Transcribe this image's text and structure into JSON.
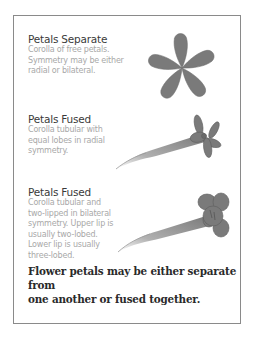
{
  "sections": [
    {
      "title": "Petals Separate",
      "lines": [
        "Corolla of free petals.",
        "Symmetry may be either",
        "radial or bilateral."
      ]
    },
    {
      "title": "Petals Fused",
      "lines": [
        "Corolla tubular with",
        "equal lobes in radial",
        "symmetry."
      ]
    },
    {
      "title": "Petals Fused",
      "lines": [
        "Corolla tubular and",
        "two-lipped in bilateral",
        "symmetry.  Upper lip is",
        "usually two-lobed.",
        "Lower lip is usually",
        "three-lobed."
      ]
    }
  ],
  "caption": {
    "line1": "Flower petals may be either separate from",
    "line2": "one another or fused together."
  },
  "colors": {
    "petal_fill": "#7a7a7a",
    "petal_stroke": "#5e5e5e",
    "frame_border": "#8a8a8a"
  }
}
